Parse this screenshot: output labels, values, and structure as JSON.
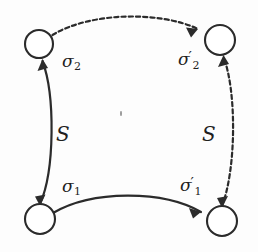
{
  "figure": {
    "width": 258,
    "height": 252,
    "background_color": "#fdfdfd",
    "ink_color": "#2b2b2b"
  },
  "nodes": [
    {
      "id": "top-left",
      "cx": 39,
      "cy": 44,
      "r": 14
    },
    {
      "id": "top-right",
      "cx": 220,
      "cy": 40,
      "r": 15
    },
    {
      "id": "bottom-left",
      "cx": 40,
      "cy": 219,
      "r": 15
    },
    {
      "id": "bottom-right",
      "cx": 222,
      "cy": 221,
      "r": 15
    }
  ],
  "edges": [
    {
      "id": "top-edge",
      "style": "dashed",
      "from": "top-left",
      "to": "top-right",
      "arrow_at": "end",
      "label": "sigma-2-prime"
    },
    {
      "id": "bottom-edge",
      "style": "solid",
      "from": "bottom-left",
      "to": "bottom-right",
      "arrow_at": "end",
      "label": "sigma-1-prime"
    },
    {
      "id": "left-edge",
      "style": "solid",
      "from": "bottom-left",
      "to": "top-left",
      "arrow_at": "both",
      "label": "S"
    },
    {
      "id": "right-edge",
      "style": "dashed",
      "from": "bottom-right",
      "to": "top-right",
      "arrow_at": "both",
      "label": "S"
    }
  ],
  "labels": {
    "sigma_2": {
      "base": "σ",
      "sub": "2",
      "prime": "",
      "x": 62,
      "y": 53
    },
    "sigma_2_prime": {
      "base": "σ",
      "sub": "2",
      "prime": "′",
      "x": 178,
      "y": 50
    },
    "sigma_1": {
      "base": "σ",
      "sub": "1",
      "prime": "",
      "x": 62,
      "y": 178
    },
    "sigma_1_prime": {
      "base": "σ",
      "sub": "1",
      "prime": "′",
      "x": 180,
      "y": 176
    },
    "s_left": {
      "text": "S",
      "x": 56,
      "y": 124
    },
    "s_right": {
      "text": "S",
      "x": 202,
      "y": 124
    }
  },
  "artifacts": {
    "speck": {
      "x": 120,
      "y": 111
    }
  }
}
